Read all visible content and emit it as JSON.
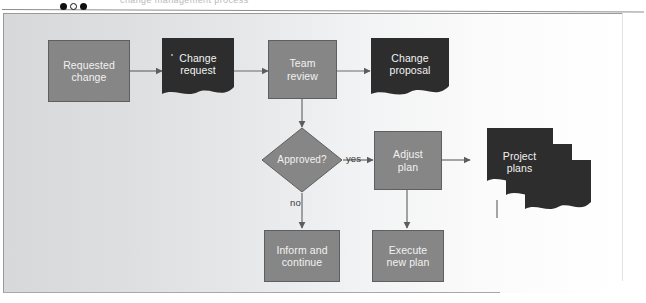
{
  "page": {
    "clipped_header_text": "change management process",
    "bullets": [
      "filled",
      "hollow",
      "filled"
    ]
  },
  "diagram": {
    "colors": {
      "process_fill": "#868686",
      "process_stroke": "#5f5f5f",
      "document_fill": "#2d2d2d",
      "label_text": "#f2f2f2",
      "connector": "#6b6b6b",
      "panel_light": "#d6d8da",
      "panel_white": "#ffffff"
    },
    "nodes": [
      {
        "id": "requested-change",
        "label": "Requested\nchange",
        "type": "process"
      },
      {
        "id": "change-request",
        "label": "Change\nrequest",
        "type": "document"
      },
      {
        "id": "team-review",
        "label": "Team\nreview",
        "type": "process"
      },
      {
        "id": "change-proposal",
        "label": "Change\nproposal",
        "type": "document"
      },
      {
        "id": "approved",
        "label": "Approved?",
        "type": "decision"
      },
      {
        "id": "adjust-plan",
        "label": "Adjust\nplan",
        "type": "process"
      },
      {
        "id": "project-plans",
        "label": "Project\nplans",
        "type": "document-stack"
      },
      {
        "id": "inform-continue",
        "label": "Inform and\ncontinue",
        "type": "process"
      },
      {
        "id": "execute-new-plan",
        "label": "Execute\nnew plan",
        "type": "process"
      }
    ],
    "edge_labels": [
      {
        "id": "yes",
        "text": "yes"
      },
      {
        "id": "no",
        "text": "no"
      }
    ],
    "edges": [
      {
        "from": "requested-change",
        "to": "change-request"
      },
      {
        "from": "change-request",
        "to": "team-review"
      },
      {
        "from": "team-review",
        "to": "change-proposal"
      },
      {
        "from": "team-review",
        "to": "approved"
      },
      {
        "from": "approved",
        "to": "adjust-plan",
        "label": "yes"
      },
      {
        "from": "approved",
        "to": "inform-continue",
        "label": "no"
      },
      {
        "from": "adjust-plan",
        "to": "project-plans"
      },
      {
        "from": "adjust-plan",
        "to": "execute-new-plan"
      },
      {
        "from": "project-plans",
        "to": "execute-new-plan"
      }
    ]
  }
}
